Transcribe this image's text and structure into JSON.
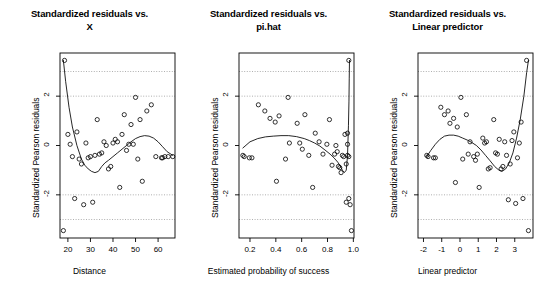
{
  "figure": {
    "ylabel": "Standardized Pearson residuals",
    "y_ticks": [
      "2",
      "0",
      "-2"
    ],
    "y_tick_values": [
      2,
      0,
      -2
    ],
    "ylim": [
      -3.75,
      3.75
    ],
    "gridlines": [
      3,
      2,
      -2,
      -3
    ],
    "marker": "open-circle",
    "curve": "loess-smooth",
    "color_axis": "#000000",
    "color_grid": "#8c8c8c",
    "color_point": "#000000",
    "background": "#ffffff"
  },
  "chart_data": [
    {
      "type": "scatter",
      "id": "panel-distance",
      "title_line1": "Standardized residuals vs.",
      "title_line2": "X",
      "xlabel": "Distance",
      "ylabel": "Standardized Pearson residuals",
      "x_ticks": [
        "20",
        "30",
        "40",
        "50",
        "60"
      ],
      "x_tick_values": [
        20,
        30,
        40,
        50,
        60
      ],
      "xlim": [
        16.5,
        67.5
      ],
      "ylim": [
        -3.75,
        3.75
      ],
      "grid": true,
      "x": [
        18.0,
        18.5,
        20.0,
        21.0,
        22.0,
        23.0,
        24.0,
        25.0,
        26.0,
        27.0,
        28.0,
        29.0,
        30.0,
        31.0,
        32.0,
        33.0,
        34.0,
        35.0,
        36.0,
        37.0,
        38.0,
        39.0,
        40.0,
        41.0,
        42.0,
        43.0,
        44.0,
        45.0,
        46.0,
        47.0,
        48.0,
        49.0,
        50.0,
        51.0,
        52.0,
        53.0,
        55.0,
        57.0,
        59.0,
        61.5,
        62.0,
        63.0,
        64.5,
        66.5
      ],
      "y": [
        -3.45,
        3.45,
        0.45,
        0.05,
        -0.45,
        -2.15,
        0.55,
        -0.55,
        -0.75,
        -2.4,
        0.1,
        -0.5,
        -0.45,
        -2.3,
        -0.4,
        1.05,
        -0.35,
        -0.3,
        0.15,
        0.0,
        -0.95,
        -0.85,
        0.1,
        0.25,
        0.15,
        -1.7,
        0.45,
        1.25,
        -0.2,
        0.05,
        0.85,
        0.05,
        1.95,
        -0.55,
        1.05,
        -1.45,
        1.4,
        1.65,
        -0.45,
        -0.5,
        -0.5,
        -0.45,
        -0.45,
        -0.45
      ],
      "curve_x": [
        18.0,
        19.0,
        20.5,
        22.0,
        24.0,
        26.0,
        27.5,
        29.0,
        30.5,
        32.0,
        33.5,
        35.0,
        36.5,
        38.0,
        40.0,
        42.0,
        44.0,
        46.0,
        48.0,
        50.0,
        52.0,
        54.0,
        56.0,
        58.0,
        60.0,
        62.0,
        64.0,
        66.5
      ],
      "curve_y": [
        3.45,
        2.6,
        1.55,
        0.75,
        0.0,
        -0.55,
        -0.8,
        -0.95,
        -1.05,
        -1.1,
        -1.05,
        -0.85,
        -0.7,
        -0.6,
        -0.45,
        -0.3,
        -0.15,
        0.0,
        0.15,
        0.28,
        0.36,
        0.4,
        0.38,
        0.3,
        0.15,
        -0.05,
        -0.25,
        -0.4
      ]
    },
    {
      "type": "scatter",
      "id": "panel-pihat",
      "title_line1": "Standardized residuals vs.",
      "title_line2": "pi.hat",
      "xlabel": "Estimated probability of success",
      "ylabel": "Standardized Pearson residuals",
      "x_ticks": [
        "0.2",
        "0.4",
        "0.6",
        "0.8",
        "1.0"
      ],
      "x_tick_values": [
        0.2,
        0.4,
        0.6,
        0.8,
        1.0
      ],
      "xlim": [
        0.115,
        1.005
      ],
      "ylim": [
        -3.75,
        3.75
      ],
      "grid": true,
      "x": [
        0.145,
        0.155,
        0.195,
        0.215,
        0.265,
        0.315,
        0.355,
        0.395,
        0.405,
        0.425,
        0.475,
        0.495,
        0.505,
        0.565,
        0.585,
        0.605,
        0.625,
        0.655,
        0.685,
        0.705,
        0.735,
        0.765,
        0.795,
        0.815,
        0.835,
        0.855,
        0.865,
        0.875,
        0.885,
        0.895,
        0.905,
        0.915,
        0.925,
        0.935,
        0.945,
        0.945,
        0.955,
        0.955,
        0.955,
        0.965,
        0.965,
        0.965,
        0.975,
        0.985
      ],
      "y": [
        -0.4,
        -0.45,
        -0.5,
        -0.5,
        1.65,
        1.4,
        1.1,
        0.95,
        -1.45,
        1.2,
        -0.55,
        1.95,
        0.1,
        0.9,
        0.1,
        -0.15,
        1.25,
        -0.4,
        -1.7,
        0.5,
        0.15,
        -0.35,
        0.05,
        1.05,
        -0.8,
        -0.35,
        0.0,
        -0.25,
        -0.85,
        -0.9,
        -1.1,
        -0.4,
        -0.45,
        0.45,
        -0.75,
        -2.3,
        0.5,
        0.05,
        -0.4,
        3.45,
        -2.15,
        -0.45,
        -2.4,
        -3.45
      ],
      "curve_x": [
        0.145,
        0.2,
        0.26,
        0.32,
        0.38,
        0.44,
        0.5,
        0.56,
        0.62,
        0.66,
        0.7,
        0.74,
        0.78,
        0.82,
        0.85,
        0.88,
        0.9,
        0.915,
        0.93,
        0.945,
        0.955,
        0.962,
        0.966,
        0.968,
        0.97
      ],
      "curve_y": [
        -0.1,
        0.15,
        0.28,
        0.35,
        0.38,
        0.4,
        0.4,
        0.36,
        0.28,
        0.2,
        0.1,
        -0.02,
        -0.18,
        -0.35,
        -0.5,
        -0.68,
        -0.85,
        -1.0,
        -1.1,
        -1.0,
        -0.4,
        0.8,
        1.8,
        2.7,
        3.45
      ]
    },
    {
      "type": "scatter",
      "id": "panel-linear-predictor",
      "title_line1": "Standardized residuals vs.",
      "title_line2": "Linear predictor",
      "xlabel": "Linear predictor",
      "ylabel": "Standardized Pearson residuals",
      "x_ticks": [
        "-2",
        "-1",
        "0",
        "1",
        "2",
        "3"
      ],
      "x_tick_values": [
        -2,
        -1,
        0,
        1,
        2,
        3
      ],
      "xlim": [
        -2.3,
        4.0
      ],
      "ylim": [
        -3.75,
        3.75
      ],
      "grid": true,
      "x": [
        -1.82,
        -1.75,
        -1.45,
        -1.35,
        -1.05,
        -0.85,
        -0.65,
        -0.55,
        -0.35,
        -0.25,
        -0.15,
        0.05,
        0.15,
        0.35,
        0.45,
        0.55,
        0.75,
        0.85,
        0.95,
        1.05,
        1.25,
        1.35,
        1.45,
        1.55,
        1.65,
        1.85,
        1.95,
        2.05,
        2.15,
        2.25,
        2.35,
        2.45,
        2.55,
        2.65,
        2.75,
        2.85,
        2.95,
        3.05,
        3.15,
        3.25,
        3.35,
        3.45,
        3.65,
        3.75
      ],
      "y": [
        -0.4,
        -0.45,
        -0.5,
        -0.5,
        1.55,
        1.25,
        1.4,
        0.9,
        1.1,
        -1.5,
        0.75,
        1.95,
        -0.55,
        1.25,
        -0.35,
        0.15,
        -0.45,
        -0.6,
        -0.35,
        -1.7,
        0.3,
        0.1,
        0.15,
        -0.95,
        -0.9,
        1.05,
        -0.3,
        -0.35,
        0.25,
        -0.95,
        -0.85,
        0.15,
        -0.4,
        -2.2,
        -0.75,
        0.2,
        0.55,
        -2.35,
        -0.5,
        0.1,
        0.95,
        -2.15,
        3.45,
        -3.45
      ],
      "curve_x": [
        -1.82,
        -1.6,
        -1.35,
        -1.1,
        -0.85,
        -0.6,
        -0.35,
        -0.1,
        0.15,
        0.4,
        0.65,
        0.9,
        1.15,
        1.4,
        1.65,
        1.9,
        2.1,
        2.3,
        2.5,
        2.7,
        2.9,
        3.1,
        3.3,
        3.5,
        3.65,
        3.75
      ],
      "curve_y": [
        -0.45,
        -0.2,
        0.05,
        0.25,
        0.38,
        0.42,
        0.42,
        0.38,
        0.3,
        0.22,
        0.12,
        0.0,
        -0.18,
        -0.4,
        -0.62,
        -0.85,
        -0.98,
        -1.05,
        -0.95,
        -0.7,
        -0.3,
        0.3,
        1.05,
        2.0,
        2.95,
        3.45
      ]
    }
  ]
}
